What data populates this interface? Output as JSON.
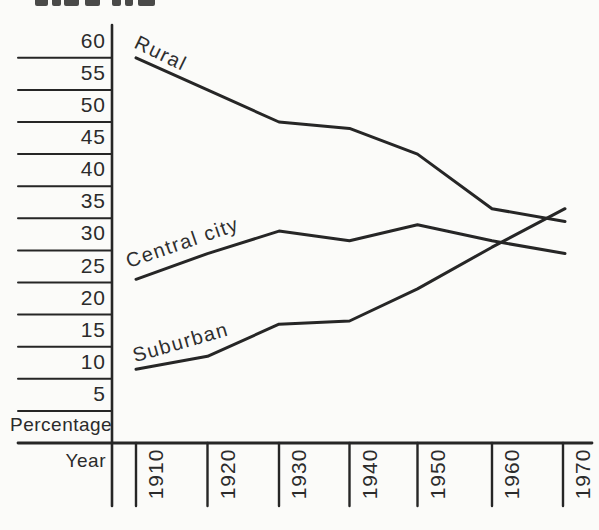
{
  "figure": {
    "y_axis_title": "Percentage",
    "x_axis_title": "Year"
  },
  "chart_data": {
    "type": "line",
    "title": "",
    "categories": [
      "1910",
      "1920",
      "1930",
      "1940",
      "1950",
      "1960",
      "1970"
    ],
    "xlabel": "Year",
    "ylabel": "Percentage",
    "y_ticks": [
      5,
      10,
      15,
      20,
      25,
      30,
      35,
      40,
      45,
      50,
      55,
      60
    ],
    "ylim": [
      0,
      65
    ],
    "grid": false,
    "legend": "inline curve labels",
    "series": [
      {
        "name": "Rural",
        "values": [
          60,
          55,
          50,
          49,
          45,
          36.5,
          34.5
        ]
      },
      {
        "name": "Central city",
        "values": [
          25.5,
          29.5,
          33,
          31.5,
          34,
          31.5,
          29.5
        ]
      },
      {
        "name": "Suburban",
        "values": [
          11.5,
          13.5,
          18.5,
          19,
          24,
          30.5,
          36.5
        ]
      }
    ],
    "colors": {
      "ink": "#262626",
      "paper": "#fbfbf9"
    }
  }
}
